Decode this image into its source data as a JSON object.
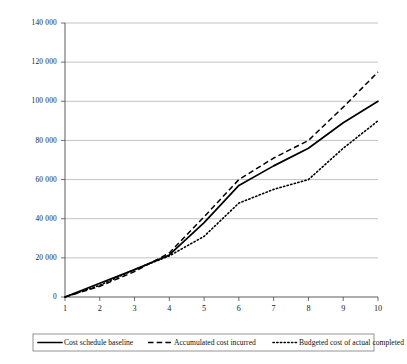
{
  "chart_data": {
    "type": "line",
    "title": "",
    "xlabel": "",
    "ylabel": "",
    "x": [
      1,
      2,
      3,
      4,
      5,
      6,
      7,
      8,
      9,
      10
    ],
    "categories": [
      "1",
      "2",
      "3",
      "4",
      "5",
      "6",
      "7",
      "8",
      "9",
      "10"
    ],
    "xlim": [
      1,
      10
    ],
    "ylim": [
      0,
      140000
    ],
    "ytick_values": [
      0,
      20000,
      40000,
      60000,
      80000,
      100000,
      120000,
      140000
    ],
    "ytick_labels": [
      "0",
      "20 000",
      "40 000",
      "60 000",
      "80 000",
      "100 000",
      "120 000",
      "140 000"
    ],
    "grid": true,
    "legend_position": "bottom",
    "series": [
      {
        "name": "Cost schedule baseline",
        "style": "solid",
        "color": "#000000",
        "values": [
          0,
          7000,
          14000,
          21500,
          38000,
          57000,
          67000,
          76000,
          89000,
          100000
        ]
      },
      {
        "name": "Accumulated cost incurred",
        "style": "dashed",
        "color": "#000000",
        "values": [
          0,
          5500,
          13000,
          22500,
          41000,
          60000,
          71000,
          80000,
          97000,
          115000
        ]
      },
      {
        "name": "Budgeted cost of actual completed",
        "style": "dotted",
        "color": "#000000",
        "values": [
          0,
          6000,
          14000,
          21000,
          31000,
          48000,
          55000,
          60000,
          76000,
          90000
        ]
      }
    ]
  },
  "legend": {
    "items": [
      {
        "label": "Cost schedule baseline",
        "style": "solid"
      },
      {
        "label": "Accumulated cost incurred",
        "style": "dashed"
      },
      {
        "label": "Budgeted cost of actual completed",
        "style": "dotted"
      }
    ]
  }
}
